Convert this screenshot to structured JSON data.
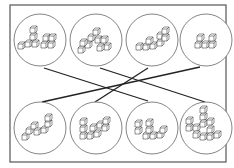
{
  "diagram": {
    "type": "matching",
    "colors": {
      "stroke": "#555555",
      "line": "#222222",
      "background": "#ffffff"
    },
    "top_row": [
      {
        "id": "T1",
        "cx": 40,
        "cy": 40
      },
      {
        "id": "T2",
        "cx": 96,
        "cy": 40
      },
      {
        "id": "T3",
        "cx": 152,
        "cy": 40
      },
      {
        "id": "T4",
        "cx": 206,
        "cy": 40
      }
    ],
    "bottom_row": [
      {
        "id": "B1",
        "cx": 40,
        "cy": 128
      },
      {
        "id": "B2",
        "cx": 96,
        "cy": 128
      },
      {
        "id": "B3",
        "cx": 152,
        "cy": 128
      },
      {
        "id": "B4",
        "cx": 206,
        "cy": 128
      }
    ],
    "connections": [
      {
        "from": "T1",
        "to": "B3"
      },
      {
        "from": "T2",
        "to": "B4"
      },
      {
        "from": "T3",
        "to": "B2"
      },
      {
        "from": "T4",
        "to": "B1"
      }
    ]
  }
}
